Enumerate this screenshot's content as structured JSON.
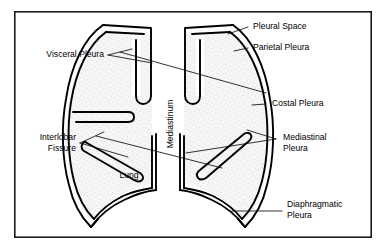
{
  "figure": {
    "frame": {
      "x": 14,
      "y": 11,
      "width": 358,
      "height": 227,
      "color": "#1a1a1a"
    },
    "canvas": {
      "width": 386,
      "height": 252,
      "background": "#ffffff"
    },
    "ink_color": "#000000",
    "lung_fill_color": "#f4f4f4",
    "stipple_color": "#9a9a9a"
  },
  "labels": {
    "pleural_space": "Pleural Space",
    "parietal_pleura": "Parietal Pleura",
    "costal_pleura": "Costal Pleura",
    "mediastinal_pleura_line1": "Mediastinal",
    "mediastinal_pleura_line2": "Pleura",
    "diaphragmatic_pleura_line1": "Diaphragmatic",
    "diaphragmatic_pleura_line2": "Pleura",
    "visceral_pleura": "Visceral Pleura",
    "interlobar_fissure_line1": "Interlobar",
    "interlobar_fissure_line2": "Fissure",
    "lung": "Lung",
    "mediastinum": "Mediastinum"
  }
}
